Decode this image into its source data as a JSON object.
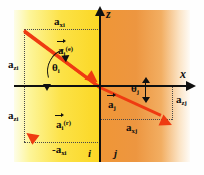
{
  "figure": {
    "accent_color": "#ef3b11",
    "axis_color": "#101010",
    "media_i_color": "#fce247",
    "media_j_color": "#f09636"
  },
  "axes": {
    "vertical_label": "z",
    "horizontal_label": "x"
  },
  "regions": [
    {
      "id": "region-i",
      "label": "i"
    },
    {
      "id": "region-j",
      "label": "j"
    }
  ],
  "amplitudes": {
    "top_horizontal": {
      "base": "a",
      "sub": "xi"
    },
    "left_upper_vertical": {
      "base": "a",
      "sub": "zi"
    },
    "left_lower_vertical": {
      "base": "a",
      "sub": "zi"
    },
    "bottom_left_horizontal": {
      "base": "-a",
      "sub": "xi"
    },
    "right_vertical": {
      "base": "a",
      "sub": "zj"
    },
    "bottom_right_horizontal": {
      "base": "a",
      "sub": "xj"
    }
  },
  "vectors": [
    {
      "id": "incident",
      "base": "a",
      "sub": "i",
      "sup": "(e)"
    },
    {
      "id": "reflected",
      "base": "a",
      "sub": "i",
      "sup": "(r)"
    },
    {
      "id": "transmitted",
      "base": "a",
      "sub": "j",
      "sup": ""
    }
  ],
  "angles": [
    {
      "id": "theta-i",
      "symbol": "θ",
      "sub": "i"
    },
    {
      "id": "theta-j",
      "symbol": "θ",
      "sub": "j"
    }
  ]
}
